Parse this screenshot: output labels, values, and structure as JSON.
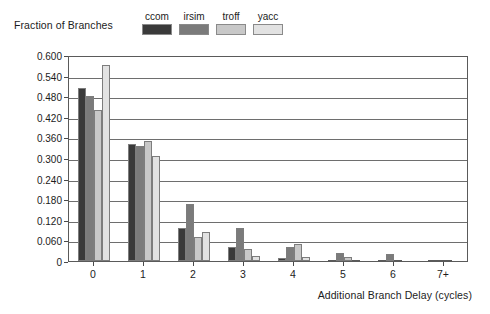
{
  "chart_data": {
    "type": "bar",
    "title": "",
    "ylabel": "Fraction of Branches",
    "xlabel": "Additional Branch Delay (cycles)",
    "categories": [
      "0",
      "1",
      "2",
      "3",
      "4",
      "5",
      "6",
      "7+"
    ],
    "ylim": [
      0,
      0.6
    ],
    "ytick_labels": [
      "0.600",
      "0.540",
      "0.480",
      "0.420",
      "0.360",
      "0.300",
      "0.240",
      "0.180",
      "0.120",
      "0.060",
      "0"
    ],
    "ytick_values": [
      0.6,
      0.54,
      0.48,
      0.42,
      0.36,
      0.3,
      0.24,
      0.18,
      0.12,
      0.06,
      0
    ],
    "grid": true,
    "legend_position": "top",
    "series": [
      {
        "name": "ccom",
        "color": "#3a3a3a",
        "values": [
          0.505,
          0.34,
          0.095,
          0.04,
          0.008,
          0.004,
          0.002,
          0.003
        ]
      },
      {
        "name": "irsim",
        "color": "#7b7b7b",
        "values": [
          0.48,
          0.334,
          0.165,
          0.095,
          0.04,
          0.022,
          0.02,
          0.004
        ]
      },
      {
        "name": "troff",
        "color": "#c8c8c8",
        "values": [
          0.44,
          0.35,
          0.07,
          0.035,
          0.05,
          0.012,
          0.001,
          0.001
        ]
      },
      {
        "name": "yacc",
        "color": "#e2e2e2",
        "values": [
          0.57,
          0.305,
          0.085,
          0.015,
          0.012,
          0.003,
          0.0,
          0.0
        ]
      }
    ]
  },
  "colors": {
    "axis": "#5a5a5a",
    "grid": "#6e6e6e",
    "text": "#1c1c1c",
    "background": "#ffffff"
  }
}
